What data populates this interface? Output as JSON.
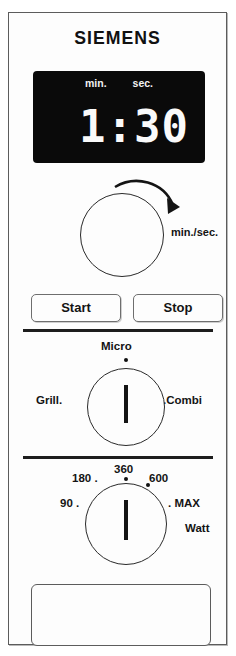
{
  "brand": "SIEMENS",
  "display": {
    "min_label": "min.",
    "sec_label": "sec.",
    "value": "1:30"
  },
  "timer_dial": {
    "label": "min./sec.",
    "rotation_icon": "clockwise-arrow-icon"
  },
  "buttons": {
    "start": "Start",
    "stop": "Stop"
  },
  "mode_dial": {
    "micro": "Micro",
    "grill": "Grill.",
    "combi": ".Combi",
    "selected": "Micro"
  },
  "power_dial": {
    "unit": "Watt",
    "settings": [
      "90 .",
      "180 .",
      "360",
      "600",
      ". MAX"
    ],
    "tick_90": "90 .",
    "tick_180": "180 .",
    "tick_360": "360",
    "tick_600": "600",
    "tick_max": ". MAX",
    "selected": "360"
  },
  "colors": {
    "display_background": "#0a0a0a",
    "display_text": "#fafafa",
    "panel_background": "#fdfdfd",
    "outline": "#2a2a2a"
  }
}
